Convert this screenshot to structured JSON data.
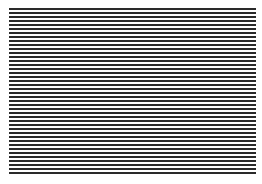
{
  "pattern": {
    "type": "horizontal-stripes",
    "stripe_count": 42,
    "dark_color": "#2a2a2a",
    "light_color": "#ffffff"
  }
}
